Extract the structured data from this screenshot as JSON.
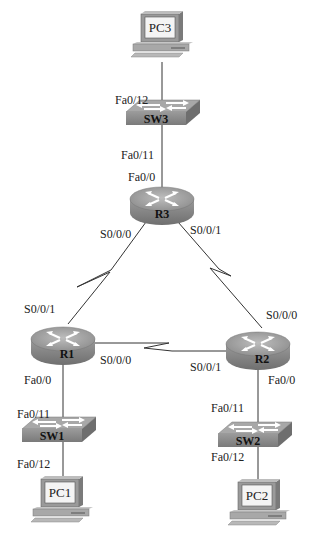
{
  "diagram": {
    "type": "network-topology",
    "devices": [
      {
        "id": "pc3",
        "name": "PC3",
        "kind": "pc"
      },
      {
        "id": "sw3",
        "name": "SW3",
        "kind": "switch"
      },
      {
        "id": "r3",
        "name": "R3",
        "kind": "router"
      },
      {
        "id": "r1",
        "name": "R1",
        "kind": "router"
      },
      {
        "id": "r2",
        "name": "R2",
        "kind": "router"
      },
      {
        "id": "sw1",
        "name": "SW1",
        "kind": "switch"
      },
      {
        "id": "sw2",
        "name": "SW2",
        "kind": "switch"
      },
      {
        "id": "pc1",
        "name": "PC1",
        "kind": "pc"
      },
      {
        "id": "pc2",
        "name": "PC2",
        "kind": "pc"
      }
    ],
    "links": [
      {
        "from": "pc3",
        "to": "sw3",
        "type": "ethernet",
        "to_port": "Fa0/12"
      },
      {
        "from": "sw3",
        "to": "r3",
        "type": "ethernet",
        "from_port": "Fa0/11",
        "to_port": "Fa0/0"
      },
      {
        "from": "r3",
        "to": "r1",
        "type": "serial",
        "from_port": "S0/0/0",
        "to_port": "S0/0/1"
      },
      {
        "from": "r3",
        "to": "r2",
        "type": "serial",
        "from_port": "S0/0/1",
        "to_port": "S0/0/0"
      },
      {
        "from": "r1",
        "to": "r2",
        "type": "serial",
        "from_port": "S0/0/0",
        "to_port": "S0/0/1"
      },
      {
        "from": "r1",
        "to": "sw1",
        "type": "ethernet",
        "from_port": "Fa0/0",
        "to_port": "Fa0/11"
      },
      {
        "from": "sw1",
        "to": "pc1",
        "type": "ethernet",
        "from_port": "Fa0/12"
      },
      {
        "from": "r2",
        "to": "sw2",
        "type": "ethernet",
        "from_port": "Fa0/0",
        "to_port": "Fa0/11"
      },
      {
        "from": "sw2",
        "to": "pc2",
        "type": "ethernet",
        "from_port": "Fa0/12"
      }
    ]
  },
  "labels": {
    "pc3": "PC3",
    "sw3": "SW3",
    "r3": "R3",
    "r1": "R1",
    "r2": "R2",
    "sw1": "SW1",
    "sw2": "SW2",
    "pc1": "PC1",
    "pc2": "PC2",
    "sw3_fa012": "Fa0/12",
    "sw3_fa011": "Fa0/11",
    "r3_fa00": "Fa0/0",
    "r3_s000": "S0/0/0",
    "r3_s001": "S0/0/1",
    "r1_s001": "S0/0/1",
    "r1_s000": "S0/0/0",
    "r1_fa00": "Fa0/0",
    "r2_s000": "S0/0/0",
    "r2_s001": "S0/0/1",
    "r2_fa00": "Fa0/0",
    "sw1_fa011": "Fa0/11",
    "sw1_fa012": "Fa0/12",
    "sw2_fa011": "Fa0/11",
    "sw2_fa012": "Fa0/12"
  },
  "colors": {
    "device_body": "#8a8a8a",
    "device_top": "#a9a9a9",
    "link": "#333333",
    "screen": "#f2f2f2",
    "background": "#ffffff"
  }
}
